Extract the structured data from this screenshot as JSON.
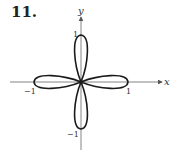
{
  "problem_number": "11.",
  "axes": {
    "x_label": "x",
    "y_label": "y",
    "tick_labels": {
      "x_pos": "1",
      "x_neg": "−1",
      "y_pos": "1",
      "y_neg": "−1"
    }
  },
  "curve": {
    "type": "four-leaved rose",
    "petals": 4,
    "petal_length": 1,
    "petal_directions": [
      "up",
      "down",
      "left",
      "right"
    ],
    "stroke_color": "#1a1a1a"
  },
  "colors": {
    "axis": "#555555",
    "text": "#333333"
  }
}
